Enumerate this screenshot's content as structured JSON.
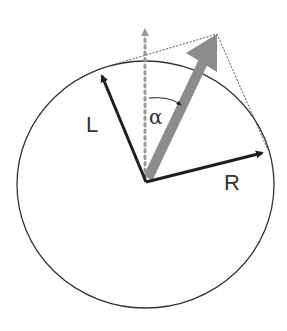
{
  "diagram": {
    "labels": {
      "left": "L",
      "right": "R",
      "angle": "α"
    },
    "colors": {
      "outline": "#333333",
      "vector": "#1f1f1f",
      "resultant": "#8c8c8c",
      "dotted_axis": "#9a9a9a",
      "construction": "#555555",
      "background": "#ffffff"
    },
    "geometry": {
      "circle": {
        "cx": 145.5,
        "cy": 184.5,
        "rx": 128.5,
        "ry": 123.5
      },
      "origin": [
        146,
        182
      ],
      "L_tip": [
        99,
        70
      ],
      "R_tip": [
        268,
        152
      ],
      "resultant_tip": [
        217,
        34
      ],
      "vertical_axis_tip": [
        145,
        20
      ]
    }
  }
}
